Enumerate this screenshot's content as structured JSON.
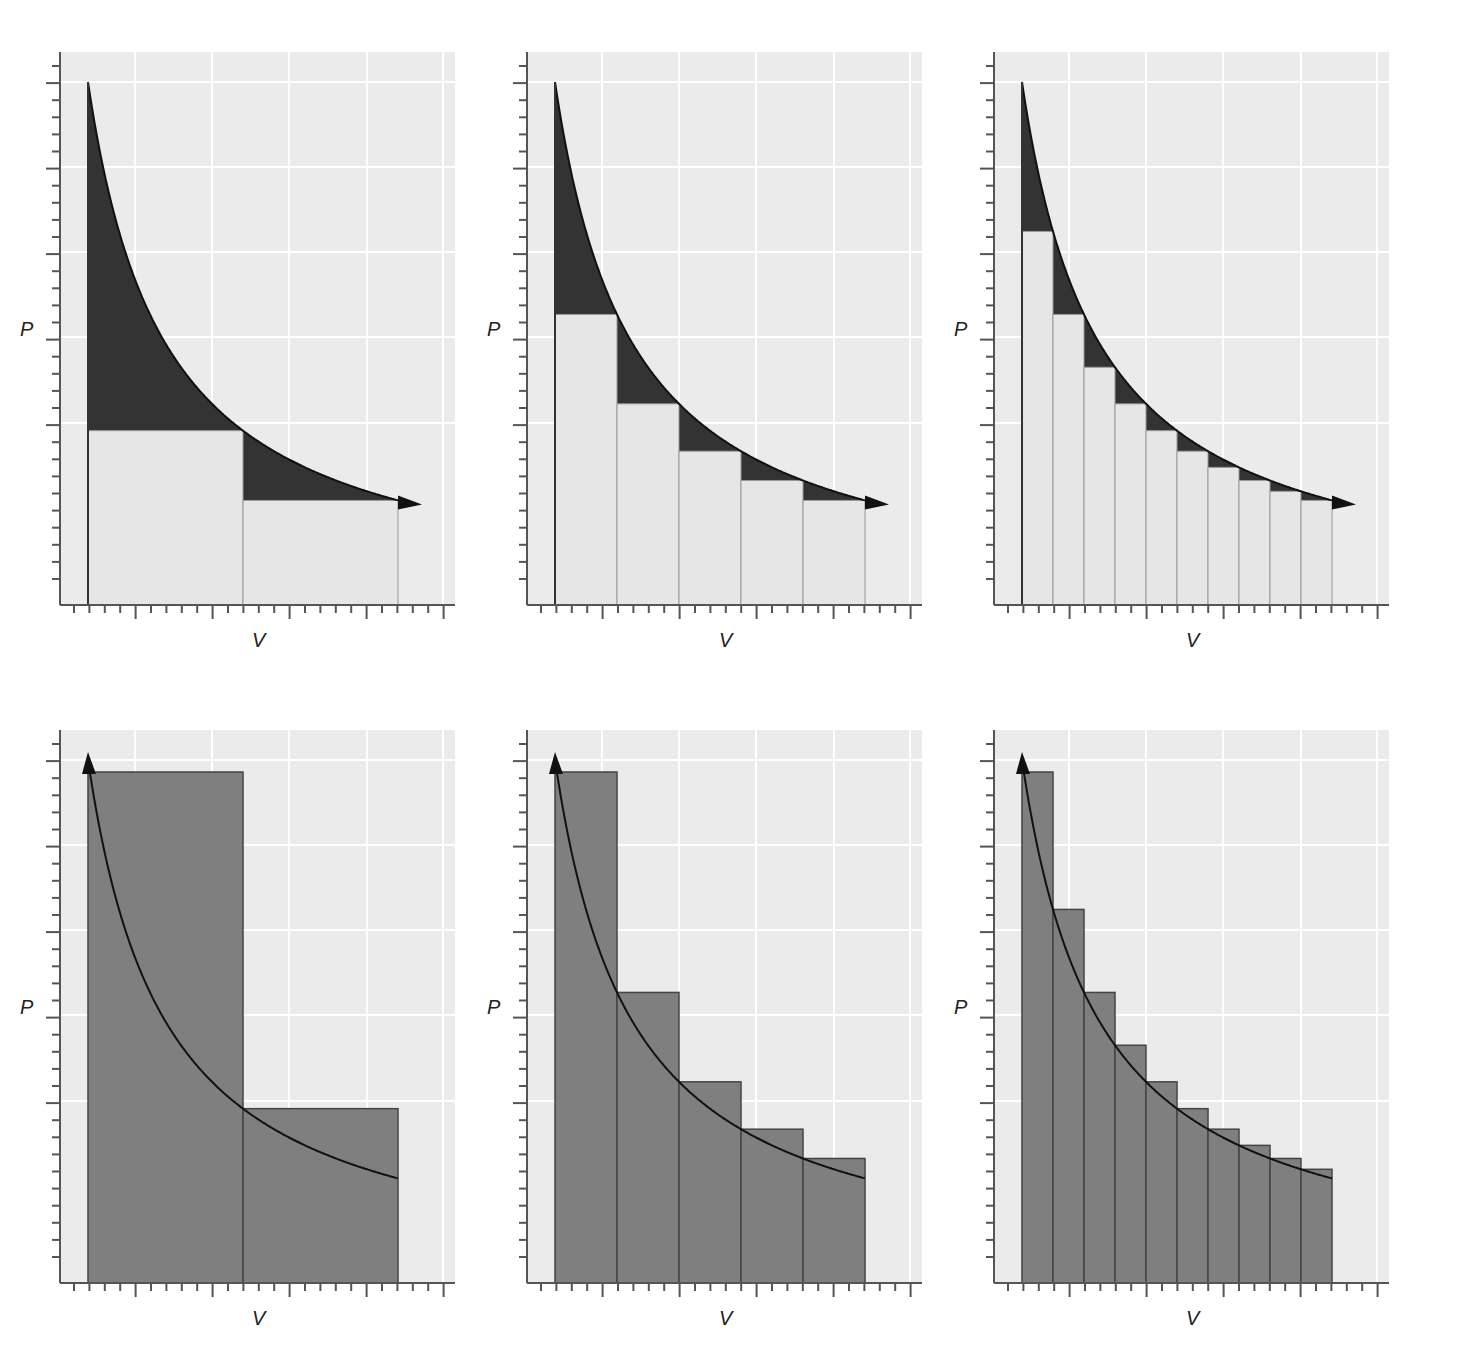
{
  "figure": {
    "axis_labels": {
      "x": "V",
      "y": "P"
    },
    "colors": {
      "plot_bg": "#ebebeb",
      "grid": "#ffffff",
      "axis": "#555555",
      "dark_fill": "#333333",
      "light_fill": "#e6e6e6",
      "bar_fill": "#7f7f7f",
      "curve": "#111111"
    }
  },
  "chart_data": [
    {
      "type": "area",
      "title": "",
      "xlabel": "V",
      "ylabel": "P",
      "row": "top",
      "steps": 2,
      "process": "expansion",
      "arrow": "right",
      "approximation": "lower"
    },
    {
      "type": "area",
      "title": "",
      "xlabel": "V",
      "ylabel": "P",
      "row": "top",
      "steps": 5,
      "process": "expansion",
      "arrow": "right",
      "approximation": "lower"
    },
    {
      "type": "area",
      "title": "",
      "xlabel": "V",
      "ylabel": "P",
      "row": "top",
      "steps": 10,
      "process": "expansion",
      "arrow": "right",
      "approximation": "lower"
    },
    {
      "type": "bar",
      "title": "",
      "xlabel": "V",
      "ylabel": "P",
      "row": "bottom",
      "steps": 2,
      "process": "compression",
      "arrow": "up",
      "approximation": "upper"
    },
    {
      "type": "bar",
      "title": "",
      "xlabel": "V",
      "ylabel": "P",
      "row": "bottom",
      "steps": 5,
      "process": "compression",
      "arrow": "up",
      "approximation": "upper"
    },
    {
      "type": "bar",
      "title": "",
      "xlabel": "V",
      "ylabel": "P",
      "row": "bottom",
      "steps": 10,
      "process": "compression",
      "arrow": "up",
      "approximation": "upper"
    }
  ],
  "panels": [
    {
      "x": 40,
      "y": 40,
      "steps": 2,
      "mode": "lower"
    },
    {
      "x": 507,
      "y": 40,
      "steps": 5,
      "mode": "lower"
    },
    {
      "x": 974,
      "y": 40,
      "steps": 10,
      "mode": "lower"
    },
    {
      "x": 40,
      "y": 718,
      "steps": 2,
      "mode": "upper"
    },
    {
      "x": 507,
      "y": 718,
      "steps": 5,
      "mode": "upper"
    },
    {
      "x": 974,
      "y": 718,
      "steps": 10,
      "mode": "upper"
    }
  ]
}
